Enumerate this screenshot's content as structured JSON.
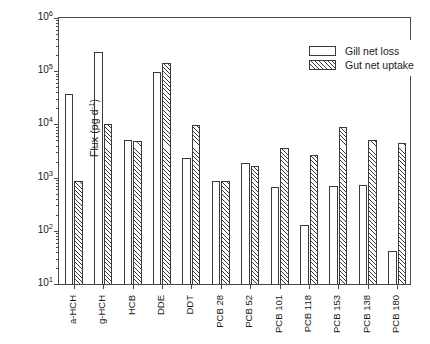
{
  "chart_data": {
    "type": "bar",
    "title": "",
    "xlabel": "",
    "ylabel": "Flux (pg d",
    "ylabel_exponent": "-1",
    "ylabel_suffix": ")",
    "scale": "log",
    "ylim": [
      10,
      1000000
    ],
    "ytick_labels": [
      "10",
      "10",
      "10",
      "10",
      "10",
      "10"
    ],
    "ytick_exponents": [
      "6",
      "5",
      "4",
      "3",
      "2",
      "1"
    ],
    "ytick_values": [
      1000000,
      100000,
      10000,
      1000,
      100,
      10
    ],
    "grid": false,
    "legend_position": "top-right",
    "categories": [
      "a-HCH",
      "g-HCH",
      "HCB",
      "DDE",
      "DDT",
      "PCB 28",
      "PCB 52",
      "PCB 101",
      "PCB 118",
      "PCB 153",
      "PCB 138",
      "PCB 180"
    ],
    "series": [
      {
        "name": "Gill net loss",
        "fill": "open",
        "values": [
          38000,
          230000,
          5000,
          98000,
          2300,
          880,
          1850,
          660,
          130,
          700,
          720,
          42
        ]
      },
      {
        "name": "Gut net uptake",
        "fill": "hatched",
        "values": [
          850,
          10000,
          4900,
          140000,
          9800,
          880,
          1650,
          3600,
          2700,
          8800,
          5200,
          4500
        ]
      }
    ]
  },
  "legend": {
    "items": [
      {
        "label": "Gill net loss",
        "swatch": "open-rectangle"
      },
      {
        "label": "Gut net uptake",
        "swatch": "hatched-rectangle"
      }
    ]
  }
}
